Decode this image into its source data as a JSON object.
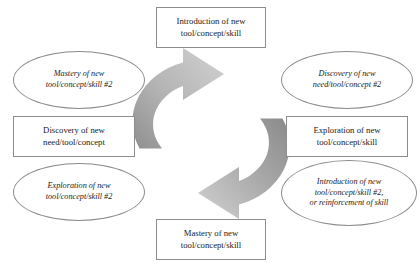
{
  "diagram": {
    "type": "cyclical-process",
    "colors": {
      "outline": "#8c8c8c",
      "text": "#1a1a1a",
      "arrow_light": "#cfcfcf",
      "arrow_dark": "#858585",
      "background": "#ffffff"
    },
    "arrows": [
      {
        "name": "ascending-arrow",
        "direction": "clockwise, pointing up-right toward top node",
        "gradient_from": "#8f8f8f",
        "gradient_to": "#cfcfcf"
      },
      {
        "name": "descending-arrow",
        "direction": "clockwise, pointing down-left toward bottom node",
        "gradient_from": "#8f8f8f",
        "gradient_to": "#cfcfcf"
      }
    ],
    "nodes": {
      "top": {
        "shape": "rectangle",
        "text": "Introduction of new\ntool/concept/skill"
      },
      "top_right": {
        "shape": "ellipse",
        "text": "Discovery of new\nneed/tool/concept #2"
      },
      "right": {
        "shape": "rectangle",
        "text": "Exploration of new\ntool/concept/skill"
      },
      "bottom_right": {
        "shape": "ellipse",
        "text": "Introduction of new\ntool/concept/skill #2,\nor reinforcement of skill"
      },
      "bottom": {
        "shape": "rectangle",
        "text": "Mastery of new\ntool/concept/skill"
      },
      "bottom_left": {
        "shape": "ellipse",
        "text": "Exploration of new\ntool/concept/skill #2"
      },
      "left": {
        "shape": "rectangle",
        "text": "Discovery of new\nneed/tool/concept"
      },
      "top_left": {
        "shape": "ellipse",
        "text": "Mastery of new\ntool/concept/skill #2"
      }
    }
  }
}
